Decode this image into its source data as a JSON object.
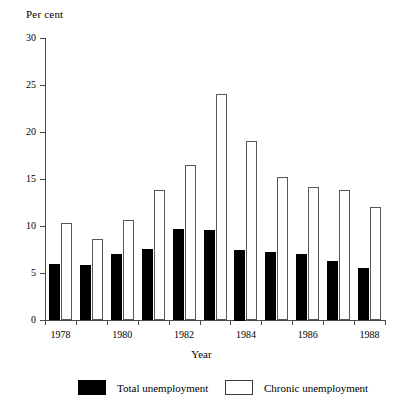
{
  "chart_data": {
    "type": "bar",
    "title": "",
    "ylabel": "Per cent",
    "xlabel": "Year",
    "categories": [
      "1978",
      "1979",
      "1980",
      "1981",
      "1982",
      "1983",
      "1984",
      "1985",
      "1986",
      "1987",
      "1988"
    ],
    "xtick_labels": [
      "1978",
      "1980",
      "1982",
      "1984",
      "1986",
      "1988"
    ],
    "ytick_labels": [
      "0",
      "5",
      "10",
      "15",
      "20",
      "25",
      "30"
    ],
    "ylim": [
      0,
      30
    ],
    "ytick_step": 5,
    "grid": false,
    "legend_position": "bottom",
    "series": [
      {
        "name": "Total unemployment",
        "color": "#000000",
        "values": [
          6.0,
          5.8,
          7.0,
          7.6,
          9.7,
          9.6,
          7.5,
          7.2,
          7.0,
          6.3,
          5.5
        ]
      },
      {
        "name": "Chronic unemployment",
        "color": "#ffffff",
        "values": [
          10.3,
          8.6,
          10.6,
          13.8,
          16.5,
          24.0,
          19.0,
          15.2,
          14.2,
          13.8,
          12.0
        ]
      }
    ]
  },
  "legend": {
    "items": [
      {
        "label": "Total unemployment",
        "swatch": "filled-black-square"
      },
      {
        "label": "Chronic unemployment",
        "swatch": "outlined-white-square"
      }
    ]
  }
}
